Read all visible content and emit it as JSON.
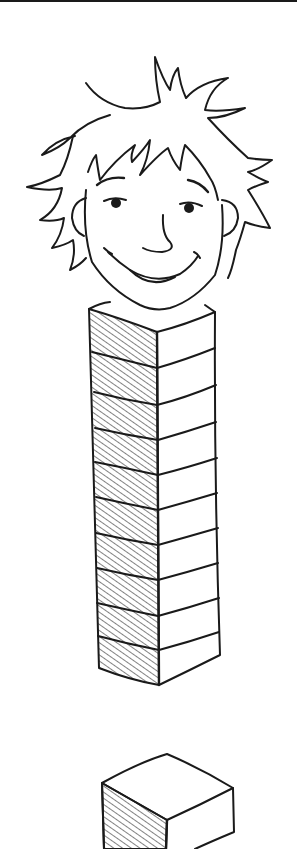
{
  "illustration": {
    "description": "Line drawing of a smiling boy's head with spiky hair atop a tall stack of ten cubes, with a single separate cube below",
    "stack_block_count": 10,
    "single_block_count": 1,
    "colors": {
      "line": "#1a1a1a",
      "background": "#ffffff"
    }
  }
}
